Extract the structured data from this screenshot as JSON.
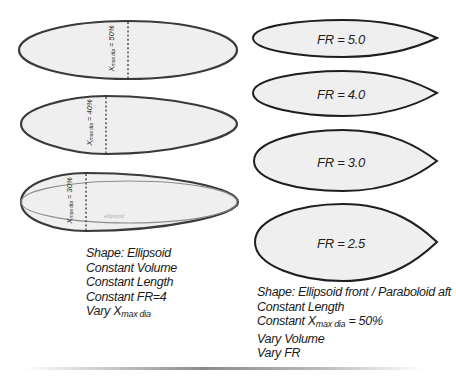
{
  "left_panel": {
    "ellipses": [
      {
        "label_var": "X",
        "label_sub": "max dia",
        "label_value": "= 50%"
      },
      {
        "label_var": "X",
        "label_sub": "max dia",
        "label_value": "= 40%"
      },
      {
        "label_var": "X",
        "label_sub": "max dia",
        "label_value": "= 30%",
        "reference_label": "ellipsoid"
      }
    ],
    "caption": {
      "line1": "Shape: Ellipsoid",
      "line2": "Constant Volume",
      "line3": "Constant Length",
      "line4": "Constant FR=4",
      "line5_prefix": "Vary X",
      "line5_sub": "max dia"
    }
  },
  "right_panel": {
    "shapes": [
      {
        "label": "FR = 5.0"
      },
      {
        "label": "FR = 4.0"
      },
      {
        "label": "FR = 3.0"
      },
      {
        "label": "FR = 2.5"
      }
    ],
    "caption": {
      "line1": "Shape: Ellipsoid front / Paraboloid aft",
      "line2": "Constant Length",
      "line3_prefix": "Constant X",
      "line3_sub": "max dia",
      "line3_suffix": " = 50%",
      "line4": "Vary Volume",
      "line5": "Vary FR"
    }
  },
  "colors": {
    "outline": "#333333",
    "fill": "#eeeeee",
    "reference_outline": "#8c8c8c"
  }
}
